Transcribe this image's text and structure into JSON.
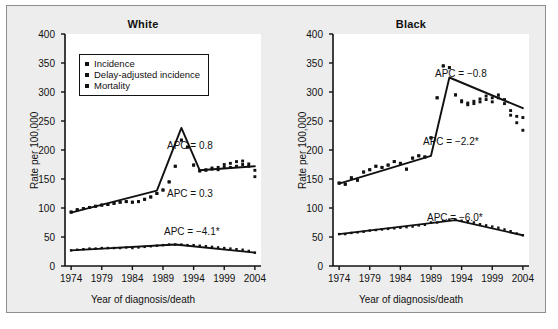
{
  "figure": {
    "background_color": "#ededed",
    "border_color": "#8d8d8d",
    "series_color": "#111111"
  },
  "axes": {
    "y_label": "Rate per 100,000",
    "x_label": "Year of diagnosis/death",
    "y_ticks": [
      "0",
      "50",
      "100",
      "150",
      "200",
      "250",
      "300",
      "350",
      "400"
    ],
    "x_ticks": [
      "1974",
      "1979",
      "1984",
      "1989",
      "1994",
      "1999",
      "2004"
    ],
    "y_min": 0,
    "y_max": 400,
    "x_min": 1973,
    "x_max": 2005
  },
  "legend": {
    "items": [
      {
        "label": "Incidence",
        "marker": "square-marker"
      },
      {
        "label": "Delay-adjusted incidence",
        "marker": "square-marker"
      },
      {
        "label": "Mortality",
        "marker": "square-marker"
      }
    ]
  },
  "panels": [
    {
      "id": "white",
      "title": "White",
      "annotations": [
        {
          "name": "apc-incidence-recent",
          "text": "APC = 0.8"
        },
        {
          "name": "apc-delay-adjusted-recent",
          "text": "APC = 0.3"
        },
        {
          "name": "apc-mortality",
          "text": "APC = −4.1*"
        }
      ]
    },
    {
      "id": "black",
      "title": "Black",
      "annotations": [
        {
          "name": "apc-incidence-recent",
          "text": "APC = −0.8"
        },
        {
          "name": "apc-delay-adjusted-recent",
          "text": "APC = −2.2*"
        },
        {
          "name": "apc-mortality",
          "text": "APC = −6.0*"
        }
      ]
    }
  ],
  "caption": {
    "text": ""
  },
  "chart_data": {
    "type": "line",
    "xlabel": "Year of diagnosis/death",
    "ylabel": "Rate per 100,000",
    "xlim": [
      1973,
      2005
    ],
    "ylim": [
      0,
      400
    ],
    "grid": false,
    "legend_position": "upper-left-inside-white-panel",
    "panels": [
      {
        "name": "White",
        "x": [
          1974,
          1975,
          1976,
          1977,
          1978,
          1979,
          1980,
          1981,
          1982,
          1983,
          1984,
          1985,
          1986,
          1987,
          1988,
          1989,
          1990,
          1991,
          1992,
          1993,
          1994,
          1995,
          1996,
          1997,
          1998,
          1999,
          2000,
          2001,
          2002,
          2003,
          2004
        ],
        "series": [
          {
            "name": "Incidence",
            "marker": "square",
            "values": [
              93,
              97,
              99,
              101,
              103,
              105,
              106,
              108,
              110,
              111,
              110,
              111,
              115,
              119,
              125,
              131,
              145,
              172,
              217,
              205,
              174,
              164,
              165,
              167,
              166,
              170,
              170,
              172,
              175,
              172,
              165
            ]
          },
          {
            "name": "Delay-adjusted incidence",
            "marker": "square",
            "values": [
              93,
              97,
              99,
              101,
              103,
              105,
              106,
              108,
              110,
              111,
              110,
              111,
              115,
              119,
              125,
              131,
              145,
              172,
              217,
              205,
              174,
              164,
              166,
              169,
              170,
              175,
              177,
              180,
              181,
              176,
              154
            ]
          },
          {
            "name": "Mortality",
            "marker": "square",
            "values": [
              27,
              28,
              29,
              30,
              30,
              31,
              31,
              31,
              31,
              32,
              31,
              32,
              33,
              34,
              35,
              36,
              37,
              37,
              37,
              36,
              36,
              35,
              34,
              33,
              32,
              31,
              30,
              29,
              28,
              26,
              23
            ]
          }
        ],
        "fitted_lines": [
          {
            "name": "joinpoint-fit-incidence",
            "x": [
              1974,
              1988,
              1992,
              1995,
              2004
            ],
            "y": [
              92,
              130,
              238,
              165,
              172
            ]
          },
          {
            "name": "joinpoint-fit-mortality",
            "x": [
              1974,
              1991,
              2004
            ],
            "y": [
              27,
              37,
              23
            ]
          }
        ],
        "apc": [
          {
            "label": "APC = 0.8",
            "value": 0.8,
            "significant": false,
            "applies_to": "Delay-adjusted incidence 1995-2004"
          },
          {
            "label": "APC = 0.3",
            "value": 0.3,
            "significant": false,
            "applies_to": "Incidence 1995-2004"
          },
          {
            "label": "APC = −4.1*",
            "value": -4.1,
            "significant": true,
            "applies_to": "Mortality 1991-2004"
          }
        ]
      },
      {
        "name": "Black",
        "x": [
          1974,
          1975,
          1976,
          1977,
          1978,
          1979,
          1980,
          1981,
          1982,
          1983,
          1984,
          1985,
          1986,
          1987,
          1988,
          1989,
          1990,
          1991,
          1992,
          1993,
          1994,
          1995,
          1996,
          1997,
          1998,
          1999,
          2000,
          2001,
          2002,
          2003,
          2004
        ],
        "series": [
          {
            "name": "Incidence",
            "marker": "square",
            "values": [
              143,
              141,
              152,
              148,
              162,
              166,
              172,
              170,
              174,
              180,
              177,
              167,
              186,
              190,
              188,
              221,
              290,
              345,
              342,
              295,
              283,
              278,
              280,
              283,
              287,
              283,
              290,
              280,
              260,
              247,
              234
            ]
          },
          {
            "name": "Delay-adjusted incidence",
            "marker": "square",
            "values": [
              143,
              141,
              152,
              148,
              162,
              166,
              172,
              170,
              174,
              180,
              177,
              167,
              186,
              190,
              188,
              221,
              290,
              345,
              342,
              295,
              285,
              281,
              284,
              288,
              293,
              290,
              295,
              287,
              268,
              258,
              256
            ]
          },
          {
            "name": "Mortality",
            "marker": "square",
            "values": [
              55,
              55,
              57,
              58,
              59,
              61,
              62,
              63,
              64,
              65,
              66,
              67,
              68,
              70,
              71,
              75,
              75,
              78,
              80,
              80,
              78,
              77,
              75,
              72,
              70,
              68,
              66,
              63,
              60,
              56,
              53
            ]
          }
        ],
        "fitted_lines": [
          {
            "name": "joinpoint-fit-incidence",
            "x": [
              1974,
              1989,
              1992,
              2004
            ],
            "y": [
              142,
              190,
              325,
              272
            ]
          },
          {
            "name": "joinpoint-fit-mortality",
            "x": [
              1974,
              1993,
              2004
            ],
            "y": [
              55,
              79,
              53
            ]
          }
        ],
        "apc": [
          {
            "label": "APC = −0.8",
            "value": -0.8,
            "significant": false,
            "applies_to": "Delay-adjusted incidence 1992-2004"
          },
          {
            "label": "APC = −2.2*",
            "value": -2.2,
            "significant": true,
            "applies_to": "Incidence 1992-2004"
          },
          {
            "label": "APC = −6.0*",
            "value": -6.0,
            "significant": true,
            "applies_to": "Mortality 1993-2004"
          }
        ]
      }
    ]
  }
}
